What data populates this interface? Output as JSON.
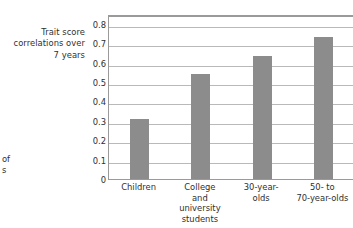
{
  "axis_caption": {
    "lines": [
      "Trait score",
      "correlations over",
      "7 years"
    ]
  },
  "page_fragment": {
    "lines": [
      "of",
      "s"
    ]
  },
  "colors": {
    "bar": "#8c8c8c",
    "gridline": "#b9b9b9",
    "frame": "#9a9a9a",
    "text": "#2f2f2f",
    "background": "#ffffff"
  },
  "chart_data": {
    "type": "bar",
    "title": "",
    "subtitle": "",
    "xlabel": "",
    "ylabel": "Trait score correlations over 7 years",
    "categories": [
      "Children",
      "College and university students",
      "30-year-olds",
      "50- to 70-year-olds"
    ],
    "category_label_lines": [
      [
        "Children"
      ],
      [
        "College",
        "and",
        "university",
        "students"
      ],
      [
        "30-year-",
        "olds"
      ],
      [
        "50- to",
        "70-year-olds"
      ]
    ],
    "values": [
      0.31,
      0.54,
      0.635,
      0.73
    ],
    "ylim": [
      0,
      0.85
    ],
    "yticks": [
      0,
      0.1,
      0.2,
      0.3,
      0.4,
      0.5,
      0.6,
      0.7,
      0.8
    ],
    "ytick_labels": [
      "0",
      "0.1",
      "0.2",
      "0.3",
      "0.4",
      "0.5",
      "0.6",
      "0.7",
      "0.8"
    ],
    "grid": true,
    "grid_axis": "y",
    "legend": false,
    "legend_position": "none",
    "bar_color": "#8c8c8c"
  }
}
